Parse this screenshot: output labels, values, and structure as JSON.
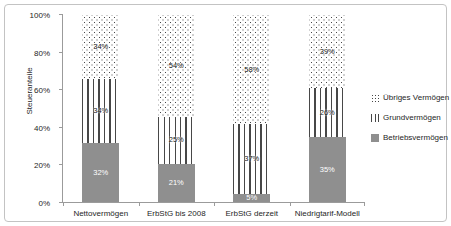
{
  "chart_data": {
    "type": "bar",
    "subtype": "stacked-percent",
    "title": "",
    "ylabel": "Steueranteile",
    "xlabel": "",
    "ylim": [
      0,
      100
    ],
    "yticks": [
      "0%",
      "20%",
      "40%",
      "60%",
      "80%",
      "100%"
    ],
    "grid": false,
    "legend_position": "right",
    "categories": [
      "Nettovermögen",
      "ErbStG bis 2008",
      "ErbStG derzeit",
      "Niedrigtarif-Modell"
    ],
    "series": [
      {
        "name": "Betriebsvermögen",
        "pattern": "solid",
        "values": [
          32,
          21,
          5,
          35
        ],
        "labels": [
          "32%",
          "21%",
          "5%",
          "35%"
        ]
      },
      {
        "name": "Grundvermögen",
        "pattern": "vlines",
        "values": [
          34,
          25,
          37,
          26
        ],
        "labels": [
          "34%",
          "25%",
          "37%",
          "26%"
        ]
      },
      {
        "name": "Übriges Vermögen",
        "pattern": "dots",
        "values": [
          34,
          54,
          58,
          39
        ],
        "labels": [
          "34%",
          "54%",
          "58%",
          "39%"
        ]
      }
    ],
    "legend": [
      {
        "label": "Übriges Vermögen",
        "pattern": "dots"
      },
      {
        "label": "Grundvermögen",
        "pattern": "vlines"
      },
      {
        "label": "Betriebsvermögen",
        "pattern": "solid"
      }
    ],
    "colors": {
      "solid_fill": "#8f8f8f",
      "pattern_ink": "#474747",
      "axis": "#9b9b9b",
      "label_on_solid": "#ffffff",
      "label_on_pattern": "#161616",
      "frame_border": "#c3c3c3",
      "background": "#ffffff"
    }
  }
}
